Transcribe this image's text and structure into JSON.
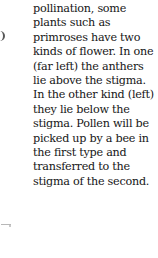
{
  "caption": {
    "lines": [
      "pollination, some",
      "plants such as",
      "primroses have two",
      "kinds of flower. In one",
      "(far left) the anthers",
      "lie above the stigma.",
      "In the other kind (left)",
      "they lie below the",
      "stigma. Pollen will be",
      "picked up by a bee in",
      "the first type and",
      "transferred to the",
      "stigma of the second."
    ]
  }
}
